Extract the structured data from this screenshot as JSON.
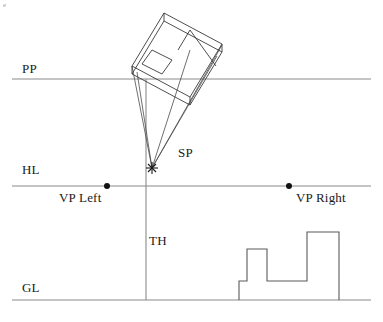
{
  "figure": {
    "corner_mark": "e",
    "background_color": "#ffffff",
    "line_color": "#3a3a3a",
    "reference_line_color": "#8a8a8a",
    "text_color": "#1a1a1a"
  },
  "labels": {
    "pp": "PP",
    "hl": "HL",
    "gl": "GL",
    "sp": "SP",
    "th": "TH",
    "vp_left": "VP Left",
    "vp_right": "VP Right"
  },
  "label_positions": {
    "pp": {
      "x": 22,
      "y": 62
    },
    "hl": {
      "x": 22,
      "y": 163
    },
    "gl": {
      "x": 22,
      "y": 281
    },
    "sp": {
      "x": 178,
      "y": 146
    },
    "th": {
      "x": 149,
      "y": 234
    },
    "vp_left": {
      "x": 59,
      "y": 191
    },
    "vp_right": {
      "x": 296,
      "y": 191
    }
  },
  "reference_lines": {
    "pp_line": {
      "x1": 12,
      "y1": 79,
      "x2": 371,
      "y2": 79
    },
    "hl_line": {
      "x1": 12,
      "y1": 186,
      "x2": 371,
      "y2": 186
    },
    "gl_line": {
      "x1": 12,
      "y1": 300,
      "x2": 371,
      "y2": 300
    },
    "th_vertical": {
      "x1": 146,
      "y1": 79,
      "x2": 146,
      "y2": 300
    }
  },
  "points": {
    "station_point": {
      "x": 152,
      "y": 168,
      "marker": "cross-star"
    },
    "vp_left_point": {
      "x": 107,
      "y": 186,
      "marker": "dot",
      "radius": 3
    },
    "vp_right_point": {
      "x": 289,
      "y": 186,
      "marker": "dot",
      "radius": 3
    }
  },
  "plan_object": {
    "description": "rotated rectangular plan (building footprint) above the picture plane",
    "outer_top": [
      [
        132,
        66
      ],
      [
        164,
        13
      ],
      [
        222,
        44
      ],
      [
        190,
        97
      ]
    ],
    "outer_bottom": [
      [
        132,
        74
      ],
      [
        164,
        21
      ],
      [
        222,
        52
      ],
      [
        190,
        105
      ]
    ],
    "divider": [
      [
        190,
        32
      ],
      [
        216,
        66
      ]
    ],
    "inner_window": [
      [
        142,
        64
      ],
      [
        152,
        50
      ],
      [
        172,
        60
      ],
      [
        162,
        74
      ]
    ]
  },
  "sight_lines": {
    "description": "visual rays converging from plan corners to the station point",
    "rays": [
      {
        "from": [
          132,
          66
        ],
        "to": [
          152,
          168
        ]
      },
      {
        "from": [
          137,
          70
        ],
        "to": [
          152,
          168
        ]
      },
      {
        "from": [
          190,
          50
        ],
        "to": [
          152,
          168
        ]
      },
      {
        "from": [
          222,
          46
        ],
        "to": [
          152,
          168
        ]
      },
      {
        "from": [
          218,
          55
        ],
        "to": [
          152,
          168
        ]
      }
    ]
  },
  "elevation_profile": {
    "description": "stepped elevation / height measurement blocks sitting on the ground line",
    "outline": [
      [
        239,
        300
      ],
      [
        239,
        281
      ],
      [
        247,
        281
      ],
      [
        247,
        249
      ],
      [
        267,
        249
      ],
      [
        267,
        281
      ],
      [
        307,
        281
      ],
      [
        307,
        232
      ],
      [
        339,
        232
      ],
      [
        339,
        300
      ]
    ]
  }
}
